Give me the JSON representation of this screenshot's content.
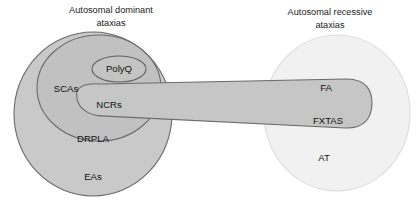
{
  "figure": {
    "title_left_line1": "Autosomal dominant",
    "title_left_line2": "ataxias",
    "title_right_line1": "Autosomal recessive",
    "title_right_line2": "ataxias",
    "background_color": "#ffffff",
    "stroke_color": "#6e6e6e",
    "text_color": "#111111"
  },
  "sets": {
    "dominant_circle": {
      "label": "Autosomal dominant ataxias",
      "fill": "#c9c9c9",
      "stroke": "#6b6b6b",
      "cx": 93,
      "cy": 114,
      "rx": 79,
      "ry": 82
    },
    "scas_ellipse": {
      "label": "SCAs",
      "fill": "#c1c1c1",
      "stroke": "#6b6b6b",
      "cx": 99,
      "cy": 88,
      "rx": 62,
      "ry": 53
    },
    "polyq_ellipse": {
      "label": "PolyQ",
      "fill": "#c4c4c4",
      "stroke": "#5f5f5f",
      "cx": 119,
      "cy": 69,
      "rx": 27,
      "ry": 13
    },
    "ncrs_band": {
      "label": "NCRs",
      "fill": "#c6c6c6",
      "stroke": "#6b6b6b"
    },
    "recessive_circle": {
      "label": "Autosomal recessive ataxias",
      "fill": "#f1f1f1",
      "stroke": "#dcdcdc",
      "cx": 337,
      "cy": 113,
      "rx": 73,
      "ry": 78
    }
  },
  "labels": [
    {
      "name": "scas",
      "text": "SCAs",
      "x": 66,
      "y": 89
    },
    {
      "name": "polyq",
      "text": "PolyQ",
      "x": 119,
      "y": 69
    },
    {
      "name": "ncrs",
      "text": "NCRs",
      "x": 109,
      "y": 105
    },
    {
      "name": "drpla",
      "text": "DRPLA",
      "x": 93,
      "y": 139
    },
    {
      "name": "eas",
      "text": "EAs",
      "x": 93,
      "y": 177
    },
    {
      "name": "fa",
      "text": "FA",
      "x": 326,
      "y": 88
    },
    {
      "name": "fxtas",
      "text": "FXTAS",
      "x": 328,
      "y": 121
    },
    {
      "name": "at",
      "text": "AT",
      "x": 324,
      "y": 158
    }
  ]
}
